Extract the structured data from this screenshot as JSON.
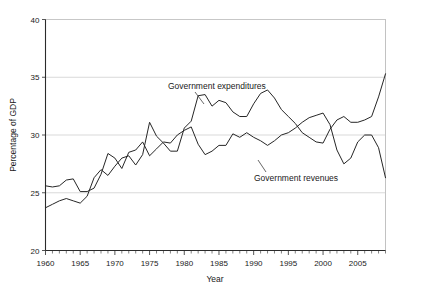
{
  "figure": {
    "background_color": "#ffffff",
    "plot_border_color": "#b4b4b4",
    "gridline_color": "#c8c8c8",
    "line_color": "#262626"
  },
  "chart_data": {
    "type": "line",
    "title": "",
    "xlabel": "Year",
    "ylabel": "Percentage of GDP",
    "xlim": [
      1960,
      2009
    ],
    "ylim": [
      20,
      40
    ],
    "ytick_values": [
      20,
      25,
      30,
      35,
      40
    ],
    "ytick_labels": [
      "20",
      "25",
      "30",
      "35",
      "40"
    ],
    "xtick_values": [
      1960,
      1965,
      1970,
      1975,
      1980,
      1985,
      1990,
      1995,
      2000,
      2005
    ],
    "xtick_labels": [
      "1960",
      "1965",
      "1970",
      "1975",
      "1980",
      "1985",
      "1990",
      "1995",
      "2000",
      "2005"
    ],
    "minor_xtick_interval": 1,
    "grid": "horizontal",
    "legend": "inline-annotations",
    "x": [
      1960,
      1961,
      1962,
      1963,
      1964,
      1965,
      1966,
      1967,
      1968,
      1969,
      1970,
      1971,
      1972,
      1973,
      1974,
      1975,
      1976,
      1977,
      1978,
      1979,
      1980,
      1981,
      1982,
      1983,
      1984,
      1985,
      1986,
      1987,
      1988,
      1989,
      1990,
      1991,
      1992,
      1993,
      1994,
      1995,
      1996,
      1997,
      1998,
      1999,
      2000,
      2001,
      2002,
      2003,
      2004,
      2005,
      2006,
      2007,
      2008,
      2009
    ],
    "series": [
      {
        "name": "Government expenditures",
        "annotation": "Government expenditures",
        "values": [
          23.7,
          24.0,
          24.3,
          24.5,
          24.3,
          24.1,
          24.7,
          26.3,
          27.0,
          26.5,
          27.3,
          28.0,
          28.2,
          27.4,
          28.3,
          31.1,
          29.9,
          29.3,
          28.6,
          28.6,
          30.6,
          31.2,
          33.4,
          33.5,
          32.5,
          33.0,
          32.8,
          32.0,
          31.6,
          31.6,
          32.7,
          33.6,
          33.9,
          33.2,
          32.2,
          31.6,
          31.0,
          30.2,
          29.8,
          29.4,
          29.3,
          30.5,
          31.3,
          31.6,
          31.1,
          31.1,
          31.3,
          31.6,
          33.3,
          35.3
        ]
      },
      {
        "name": "Government revenues",
        "annotation": "Government revenues",
        "values": [
          25.6,
          25.5,
          25.6,
          26.1,
          26.2,
          25.1,
          25.1,
          25.4,
          26.6,
          28.4,
          28.0,
          27.1,
          28.5,
          28.7,
          29.4,
          28.2,
          28.8,
          29.4,
          29.3,
          30.0,
          30.4,
          30.7,
          29.2,
          28.3,
          28.6,
          29.1,
          29.1,
          30.1,
          29.8,
          30.2,
          29.8,
          29.5,
          29.1,
          29.5,
          30.0,
          30.2,
          30.6,
          31.1,
          31.5,
          31.7,
          31.9,
          30.9,
          28.7,
          27.5,
          28.0,
          29.4,
          30.0,
          30.0,
          28.9,
          26.3
        ]
      }
    ]
  }
}
